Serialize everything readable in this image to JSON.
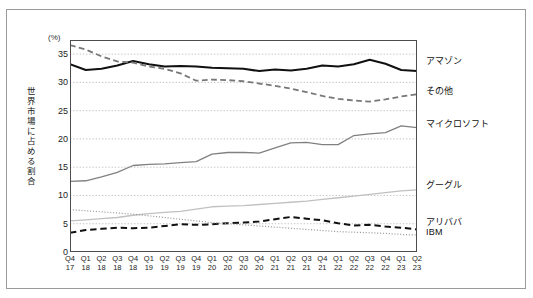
{
  "figure": {
    "cut_off_heading": "",
    "y_unit": "(%)",
    "y_axis_title": "世界市場に占める割合"
  },
  "legend": [
    {
      "name": "amazon",
      "label": "アマゾン",
      "color": "#111111",
      "style": "solid",
      "width": 2.0,
      "top": 54
    },
    {
      "name": "others",
      "label": "その他",
      "color": "#777777",
      "style": "dashed",
      "width": 1.8,
      "top": 84
    },
    {
      "name": "microsoft",
      "label": "マイクロソフト",
      "color": "#808080",
      "style": "solid",
      "width": 1.3,
      "top": 117
    },
    {
      "name": "google",
      "label": "グーグル",
      "color": "#c0c0c0",
      "style": "solid",
      "width": 1.3,
      "top": 178
    },
    {
      "name": "alibaba",
      "label": "アリババ",
      "color": "#111111",
      "style": "dashed",
      "width": 2.0,
      "top": 215
    },
    {
      "name": "ibm",
      "label": "IBM",
      "color": "#9a9a9a",
      "style": "dotted",
      "width": 1.2,
      "top": 227
    }
  ],
  "chart_data": {
    "type": "line",
    "title": "",
    "xlabel": "",
    "ylabel": "世界市場に占める割合",
    "yunit": "(%)",
    "ylim": [
      0,
      37.5
    ],
    "yticks": [
      0,
      5,
      10,
      15,
      20,
      25,
      30,
      35
    ],
    "grid": "horizontal-dotted",
    "legend_position": "right-inline",
    "categories": [
      "Q4\n17",
      "Q1\n18",
      "Q2\n18",
      "Q3\n18",
      "Q4\n18",
      "Q1\n19",
      "Q2\n19",
      "Q3\n19",
      "Q4\n19",
      "Q1\n20",
      "Q2\n20",
      "Q3\n20",
      "Q4\n20",
      "Q1\n21",
      "Q2\n21",
      "Q3\n21",
      "Q4\n21",
      "Q1\n22",
      "Q2\n22",
      "Q3\n22",
      "Q4\n22",
      "Q1\n23",
      "Q2\n23"
    ],
    "series": [
      {
        "name": "アマゾン",
        "key": "amazon",
        "color": "#111111",
        "style": "solid",
        "width": 2.0,
        "values": [
          33.2,
          32.2,
          32.4,
          33.0,
          33.8,
          33.2,
          32.8,
          32.9,
          32.8,
          32.6,
          32.5,
          32.4,
          32.0,
          32.3,
          32.1,
          32.4,
          33.0,
          32.8,
          33.2,
          34.0,
          33.3,
          32.2,
          32.0
        ]
      },
      {
        "name": "その他",
        "key": "others",
        "color": "#777777",
        "style": "dashed",
        "width": 1.8,
        "values": [
          36.6,
          35.8,
          34.6,
          33.7,
          33.5,
          32.8,
          32.4,
          31.6,
          30.3,
          30.5,
          30.4,
          30.2,
          29.8,
          29.4,
          28.9,
          28.3,
          27.6,
          27.1,
          26.8,
          26.6,
          27.0,
          27.5,
          27.9
        ]
      },
      {
        "name": "マイクロソフト",
        "key": "microsoft",
        "color": "#808080",
        "style": "solid",
        "width": 1.3,
        "values": [
          12.5,
          12.6,
          13.3,
          14.1,
          15.3,
          15.5,
          15.6,
          15.8,
          16.0,
          17.3,
          17.6,
          17.6,
          17.5,
          18.4,
          19.3,
          19.4,
          19.0,
          19.0,
          20.6,
          20.9,
          21.1,
          22.3,
          22.0
        ]
      },
      {
        "name": "グーグル",
        "key": "google",
        "color": "#c0c0c0",
        "style": "solid",
        "width": 1.3,
        "values": [
          5.5,
          5.7,
          5.9,
          6.1,
          6.5,
          6.8,
          7.0,
          7.2,
          7.6,
          8.0,
          8.1,
          8.2,
          8.4,
          8.6,
          8.8,
          9.0,
          9.3,
          9.6,
          9.9,
          10.2,
          10.5,
          10.8,
          11.0
        ]
      },
      {
        "name": "アリババ",
        "key": "alibaba",
        "color": "#111111",
        "style": "dashed",
        "width": 2.0,
        "values": [
          3.4,
          3.9,
          4.1,
          4.3,
          4.2,
          4.3,
          4.6,
          4.9,
          4.8,
          4.9,
          5.1,
          5.2,
          5.4,
          5.8,
          6.2,
          5.9,
          5.6,
          5.1,
          4.7,
          4.8,
          4.5,
          4.3,
          4.0
        ]
      },
      {
        "name": "IBM",
        "key": "ibm",
        "color": "#9a9a9a",
        "style": "dotted",
        "width": 1.2,
        "values": [
          7.5,
          7.3,
          7.1,
          6.9,
          6.7,
          6.4,
          6.1,
          5.8,
          5.5,
          5.2,
          5.0,
          4.8,
          4.6,
          4.4,
          4.2,
          4.0,
          3.8,
          3.6,
          3.5,
          3.4,
          3.3,
          3.1,
          3.0
        ]
      }
    ]
  }
}
